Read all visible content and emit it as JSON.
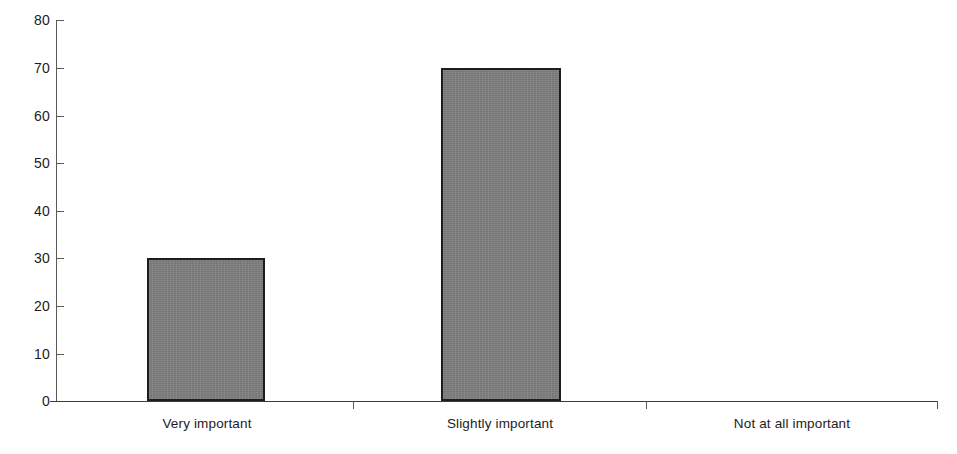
{
  "chart_data": {
    "type": "bar",
    "title": "",
    "subtitle": "",
    "xlabel": "",
    "ylabel": "",
    "categories": [
      "Very important",
      "Slightly important",
      "Not at all important"
    ],
    "values": [
      30,
      70,
      0
    ],
    "ylim": [
      0,
      80
    ],
    "yticks": [
      0,
      10,
      20,
      30,
      40,
      50,
      60,
      70,
      80
    ],
    "ytick_labels": [
      "0",
      "10",
      "20",
      "30",
      "40",
      "50",
      "60",
      "70",
      "80"
    ],
    "grid": false,
    "legend": "none",
    "series": [
      {
        "name": "",
        "values": [
          30,
          70,
          0
        ]
      }
    ],
    "bar_fill_color": "#807f7f",
    "bar_border_color": "#1d1d1d",
    "axis_color": "#3c3c3c",
    "background_color": "#ffffff"
  }
}
